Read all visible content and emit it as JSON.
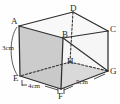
{
  "figure": {
    "type": "rectangular-prism-diagram",
    "vertices": [
      {
        "id": "A",
        "label": "A",
        "position": "top-front-left",
        "x": 19,
        "y": 26
      },
      {
        "id": "B",
        "label": "B",
        "position": "top-front-right-inner",
        "x": 63,
        "y": 38
      },
      {
        "id": "C",
        "label": "C",
        "position": "top-back-right",
        "x": 108,
        "y": 31
      },
      {
        "id": "D",
        "label": "D",
        "position": "top-back-left",
        "x": 73,
        "y": 12
      },
      {
        "id": "E",
        "label": "E",
        "position": "bottom-front-left",
        "x": 20,
        "y": 76
      },
      {
        "id": "F",
        "label": "F",
        "position": "bottom-front-center",
        "x": 61,
        "y": 89
      },
      {
        "id": "G",
        "label": "G",
        "position": "bottom-back-right",
        "x": 108,
        "y": 71
      },
      {
        "id": "H",
        "label": "H",
        "position": "bottom-hidden-center",
        "x": 70,
        "y": 62
      }
    ],
    "measurements": [
      {
        "id": "height",
        "label": "3cm",
        "value": 3,
        "unit": "cm",
        "edge": "A-E",
        "x": 6,
        "y": 47
      },
      {
        "id": "depth",
        "label": "4cm",
        "value": 4,
        "unit": "cm",
        "edge": "E-F",
        "x": 30,
        "y": 85
      },
      {
        "id": "width",
        "label": "5cm",
        "value": 5,
        "unit": "cm",
        "edge": "F-G",
        "x": 79,
        "y": 80
      }
    ],
    "shaded_faces": [
      "ABFE",
      "EFGH"
    ],
    "hidden_edges": [
      "D-H",
      "H-E",
      "H-G"
    ],
    "diagonals": [
      "B-G"
    ],
    "colors": {
      "stroke": "#2e2e2e",
      "shaded_left": "#b9b9b9",
      "shaded_bottom": "#c6c6c6",
      "background": "#fefefe",
      "label": "#2b2b2b"
    }
  }
}
